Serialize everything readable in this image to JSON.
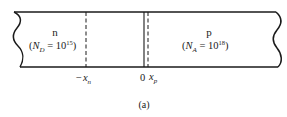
{
  "diagram": {
    "caption": "(a)",
    "regions": [
      {
        "id": "n",
        "type_label": "n",
        "doping_symbol": "N",
        "doping_sub": "D",
        "doping_eq": " = 10",
        "doping_exp": "15",
        "doping_close": ")"
      },
      {
        "id": "p",
        "type_label": "p",
        "doping_symbol": "N",
        "doping_sub": "A",
        "doping_eq": " = 10",
        "doping_exp": "18",
        "doping_close": ")"
      }
    ],
    "markers": [
      {
        "id": "minus-xn",
        "prefix": "−",
        "symbol": "x",
        "sub": "n",
        "style": "dashed"
      },
      {
        "id": "origin",
        "symbol": "0",
        "style": "solid"
      },
      {
        "id": "xp",
        "symbol": "x",
        "sub": "p",
        "style": "dashed"
      }
    ],
    "colors": {
      "stroke": "#1a1a1a",
      "background": "#ffffff"
    }
  }
}
